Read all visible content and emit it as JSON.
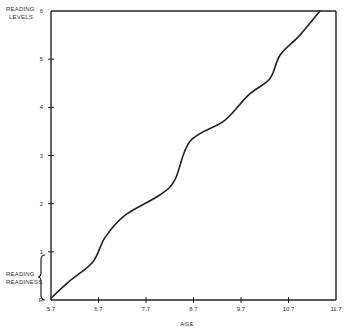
{
  "chart_data": {
    "type": "line",
    "title": "",
    "xlabel": "AGE",
    "ylabel": "READING LEVELS",
    "xlim": [
      5.7,
      11.7
    ],
    "ylim": [
      0,
      6
    ],
    "x_ticks": [
      "5.7",
      "6.7",
      "7.7",
      "8.7",
      "9.7",
      "10.7",
      "11.7"
    ],
    "y_ticks": [
      "R",
      "1",
      "2",
      "3",
      "4",
      "5",
      "6"
    ],
    "annotations": [
      {
        "text": "READING READINESS",
        "span_y": [
          0,
          1
        ],
        "style": "curly brace on y-axis"
      }
    ],
    "grid": false,
    "legend": null,
    "series": [
      {
        "name": "Reading level by age",
        "x": [
          5.7,
          6.1,
          6.58,
          6.84,
          7.26,
          7.99,
          8.31,
          8.63,
          9.36,
          9.85,
          10.31,
          10.52,
          10.94,
          11.36
        ],
        "y": [
          0.04,
          0.4,
          0.79,
          1.3,
          1.76,
          2.18,
          2.5,
          3.3,
          3.73,
          4.25,
          4.6,
          5.08,
          5.5,
          6.0
        ]
      }
    ]
  },
  "labels": {
    "y_axis_title_line1": "READING",
    "y_axis_title_line2": "LEVELS",
    "x_axis_title": "AGE",
    "readiness_line1": "READING",
    "readiness_line2": "READINESS"
  }
}
